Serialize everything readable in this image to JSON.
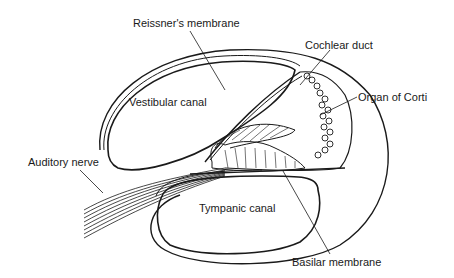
{
  "diagram": {
    "labels": {
      "reissners_membrane": "Reissner's membrane",
      "cochlear_duct": "Cochlear duct",
      "vestibular_canal": "Vestibular canal",
      "organ_of_corti": "Organ of Corti",
      "auditory_nerve": "Auditory nerve",
      "tympanic_canal": "Tympanic canal",
      "basilar_membrane": "Basilar membrane"
    },
    "colors": {
      "line": "#1a1a1a",
      "background": "#ffffff"
    }
  }
}
